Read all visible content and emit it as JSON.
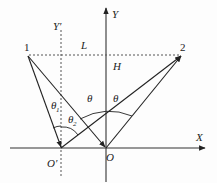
{
  "diagram": {
    "colors": {
      "line": "#222222",
      "dashed": "#555555",
      "background": "#fdfdfd"
    },
    "axes": {
      "x_label": "X",
      "y_label": "Y",
      "y_prime_label": "Y′"
    },
    "origins": {
      "o_label": "O",
      "o_prime_label": "O′"
    },
    "points": [
      {
        "id": "1",
        "label": "1"
      },
      {
        "id": "2",
        "label": "2"
      }
    ],
    "segments": {
      "horizontal_label": "L",
      "height_label": "H"
    },
    "angles": {
      "theta": "θ",
      "theta1": "θ",
      "theta1_sub": "1",
      "theta2": "θ",
      "theta2_sub": "2"
    }
  }
}
